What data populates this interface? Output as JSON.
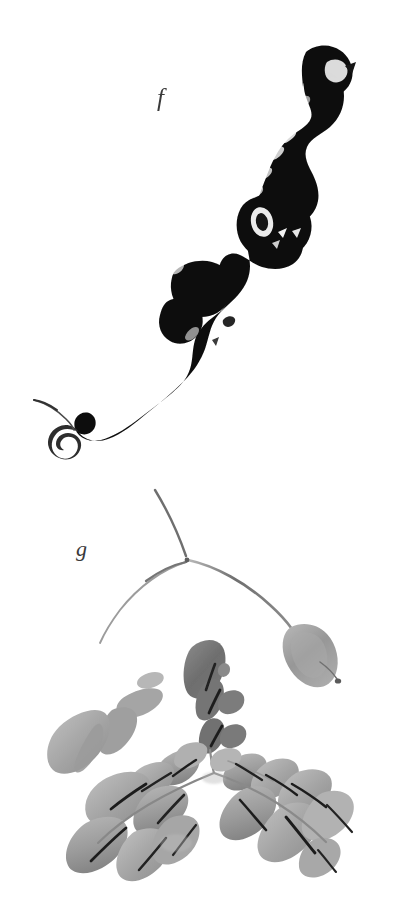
{
  "plate": {
    "title": "Ink wash botanical plate",
    "background_color": "#ffffff",
    "width": 393,
    "height": 920,
    "medium": "sumi-e brush and ink on white paper",
    "panel_count": 2
  },
  "figures": [
    {
      "id": "f",
      "label": "f",
      "label_x": 163,
      "label_y": 98,
      "caption": "f",
      "subject": "calligraphic ink brush stroke",
      "description": "Bold black serpentine brush stroke descending from upper right to lower left, with dry-brush flying-white streaks and a spiral curl terminal",
      "ink_color": "#0b0b0b",
      "region": {
        "x": 30,
        "y": 45,
        "width": 330,
        "height": 420
      }
    },
    {
      "id": "g",
      "label": "g",
      "label_x": 82,
      "label_y": 549,
      "caption": "g",
      "subject": "pinnate compound leaf with seed pod",
      "description": "Grey ink-wash drawing: three fine arcing stems from a node, a pendant seed pod at right, scattered loose leaflets at left, a dark vertical leaflet column at centre, and two pinnate compound leaf sprays below",
      "wash_color_light": "#b0b0b0",
      "wash_color_mid": "#989898",
      "wash_color_dark": "#6f6f6f",
      "vein_color": "#2b2b2b",
      "stem_color": "#808080",
      "region": {
        "x": 35,
        "y": 485,
        "width": 330,
        "height": 395
      }
    }
  ],
  "elements": {
    "stroke_f_name": "brush-stroke-f",
    "curl_name": "spiral-curl-terminal",
    "tendril_name": "thin-tendril",
    "stem_node_name": "stem-node",
    "pod_name": "seed-pod",
    "leaf_left_name": "compound-leaf-left",
    "leaf_right_name": "compound-leaf-right",
    "leaflet_column_name": "leaflet-column",
    "loose_leaflets_name": "loose-leaflets"
  },
  "colors": {
    "paper": "#ffffff",
    "ink_black": "#0b0b0b",
    "ink_soft": "#2b2b2b",
    "wash_light": "#b4b4b4",
    "wash_mid": "#9a9a9a",
    "wash_dark": "#6e6e6e",
    "stem_grey": "#7f7f7f",
    "label_grey": "#3a3a3a"
  }
}
